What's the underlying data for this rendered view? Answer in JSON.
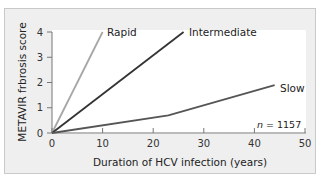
{
  "chart_data": {
    "type": "line",
    "title": "",
    "xlabel": "Duration of HCV infection (years)",
    "ylabel": "METAVIR frbrosis score",
    "xlim": [
      0,
      50
    ],
    "ylim": [
      0,
      4
    ],
    "x_ticks": [
      "0",
      "10",
      "20",
      "30",
      "40",
      "50"
    ],
    "y_ticks": [
      "0",
      "1",
      "2",
      "3",
      "4"
    ],
    "grid": false,
    "legend": "inline labels at line ends",
    "annotation": {
      "prefix": "n",
      "text": " = 1157"
    },
    "series": [
      {
        "name": "Rapid",
        "color": "#a6a6a6",
        "points": [
          [
            0,
            0
          ],
          [
            10,
            4
          ]
        ]
      },
      {
        "name": "Intermediate",
        "color": "#333333",
        "points": [
          [
            0,
            0
          ],
          [
            26,
            4
          ]
        ]
      },
      {
        "name": "Slow",
        "color": "#555555",
        "points": [
          [
            0,
            0
          ],
          [
            23,
            0.7
          ],
          [
            44,
            1.9
          ]
        ]
      }
    ]
  },
  "colors": {
    "frame_bg": "#efefef",
    "frame_border": "#c9c9c9",
    "axis": "#777777"
  }
}
